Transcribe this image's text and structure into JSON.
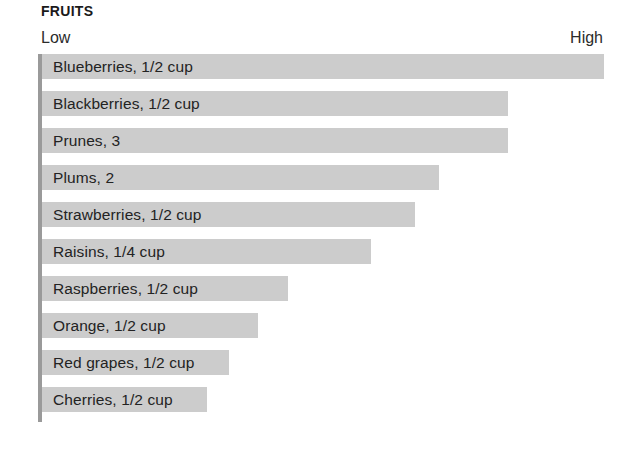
{
  "header": {
    "title": "FRUITS"
  },
  "scale": {
    "low_label": "Low",
    "high_label": "High"
  },
  "colors": {
    "bar_fill": "#cccccc",
    "axis_line": "#9a9a9a",
    "text": "#232323",
    "background": "#ffffff"
  },
  "chart_data": {
    "type": "bar",
    "orientation": "horizontal",
    "title": "FRUITS",
    "xlabel": "",
    "ylabel": "",
    "grid": false,
    "legend": "none",
    "axis_range_labels": [
      "Low",
      "High"
    ],
    "xlim": [
      0,
      100
    ],
    "categories": [
      "Blueberries, 1/2 cup",
      "Blackberries, 1/2 cup",
      "Prunes, 3",
      "Plums, 2",
      "Strawberries, 1/2 cup",
      "Raisins, 1/4 cup",
      "Raspberries, 1/2 cup",
      "Orange, 1/2 cup",
      "Red grapes, 1/2 cup",
      "Cherries, 1/2 cup"
    ],
    "values": [
      100,
      83,
      83,
      70.6,
      66.3,
      58.6,
      43.7,
      38.5,
      33.3,
      29.4
    ]
  },
  "rows": [
    {
      "label": "Blueberries, 1/2 cup",
      "value": 100,
      "width_pct": "100%"
    },
    {
      "label": "Blackberries, 1/2 cup",
      "value": 83,
      "width_pct": "83%"
    },
    {
      "label": "Prunes, 3",
      "value": 83,
      "width_pct": "83%"
    },
    {
      "label": "Plums, 2",
      "value": 70.6,
      "width_pct": "70.6%"
    },
    {
      "label": "Strawberries, 1/2 cup",
      "value": 66.3,
      "width_pct": "66.3%"
    },
    {
      "label": "Raisins, 1/4 cup",
      "value": 58.6,
      "width_pct": "58.6%"
    },
    {
      "label": "Raspberries, 1/2 cup",
      "value": 43.7,
      "width_pct": "43.7%"
    },
    {
      "label": "Orange, 1/2 cup",
      "value": 38.5,
      "width_pct": "38.5%"
    },
    {
      "label": "Red grapes, 1/2 cup",
      "value": 33.3,
      "width_pct": "33.3%"
    },
    {
      "label": "Cherries, 1/2 cup",
      "value": 29.4,
      "width_pct": "29.4%"
    }
  ]
}
